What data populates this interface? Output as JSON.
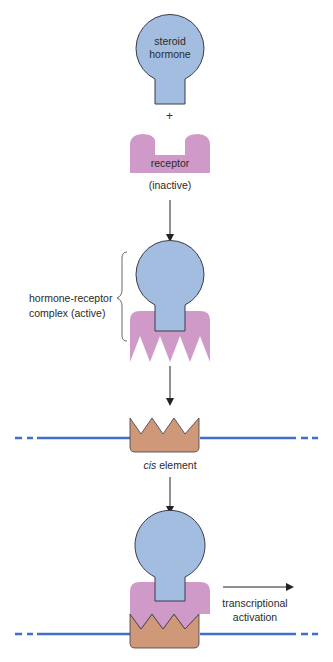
{
  "diagram": {
    "type": "flow",
    "steps": [
      {
        "id": "hormone",
        "label_line1": "steroid",
        "label_line2": "hormone"
      },
      {
        "id": "plus",
        "symbol": "+"
      },
      {
        "id": "receptor",
        "label": "receptor",
        "state": "(inactive)"
      },
      {
        "id": "complex",
        "label_line1": "hormone-receptor",
        "label_line2": "complex (active)"
      },
      {
        "id": "cis",
        "label_italic": "cis",
        "label_rest": " element"
      },
      {
        "id": "activation",
        "label_line1": "transcriptional",
        "label_line2": "activation"
      }
    ],
    "colors": {
      "hormone_fill": "#a3bde0",
      "receptor_fill": "#cf9ac8",
      "cis_fill": "#cf9878",
      "dna_line": "#3f6fcc",
      "outline": "#3a3a4a",
      "arrow": "#222222"
    }
  }
}
